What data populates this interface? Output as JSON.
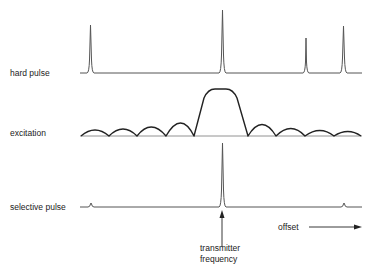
{
  "diagram": {
    "rows": [
      {
        "label": "hard pulse"
      },
      {
        "label": "excitation"
      },
      {
        "label": "selective pulse"
      }
    ],
    "annotations": {
      "axis_label": "offset",
      "marker_line1": "transmitter",
      "marker_line2": "frequency"
    },
    "colors": {
      "trace": "#555555",
      "curve": "#222222",
      "text": "#222222"
    }
  }
}
